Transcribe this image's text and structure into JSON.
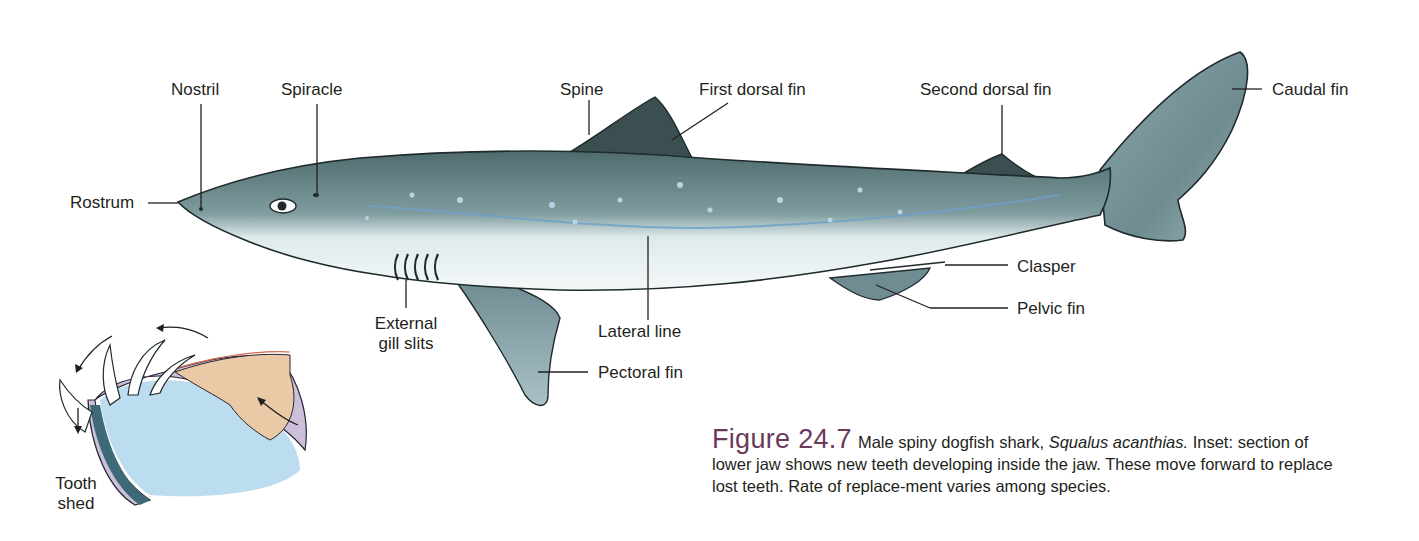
{
  "figure": {
    "number": "Figure 24.7",
    "caption_lead": "Male spiny dogfish shark, ",
    "species_name": "Squalus acanthias.",
    "caption_body": "Inset: section of lower jaw shows new teeth developing inside the jaw. These move forward to replace lost teeth. Rate of replace-ment varies among species."
  },
  "labels": {
    "nostril": "Nostril",
    "spiracle": "Spiracle",
    "spine": "Spine",
    "first_dorsal_fin": "First dorsal fin",
    "second_dorsal_fin": "Second dorsal fin",
    "caudal_fin": "Caudal fin",
    "rostrum": "Rostrum",
    "clasper": "Clasper",
    "pelvic_fin": "Pelvic fin",
    "external_gill_slits_line1": "External",
    "external_gill_slits_line2": "gill slits",
    "lateral_line": "Lateral line",
    "pectoral_fin": "Pectoral fin",
    "tooth_shed_line1": "Tooth",
    "tooth_shed_line2": "shed"
  },
  "colors": {
    "body_dark": "#4f6b6e",
    "body_mid": "#7f9c9f",
    "belly": "#eef4f4",
    "fin_dark": "#3c4f50",
    "fin_light": "#8eaab0",
    "spot": "#b9d3e4",
    "lateral_line": "#6fa1c8",
    "jaw_purple": "#cbbfd9",
    "jaw_tan": "#e9c9a6",
    "jaw_blue": "#bcdcef",
    "caption_accent": "#6b3a5a"
  }
}
